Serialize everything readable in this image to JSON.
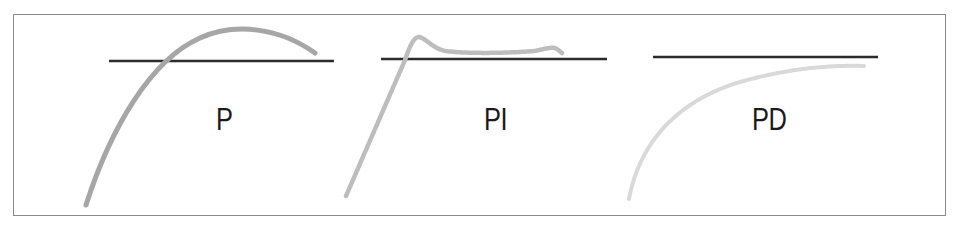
{
  "diagram": {
    "title": "",
    "panels": [
      {
        "id": "p",
        "label": "P",
        "response_style": "solid",
        "response_color": "#a6a6a6",
        "behavior": "rises steeply, overshoots setpoint, peaks, then falls back toward setpoint"
      },
      {
        "id": "pi",
        "label": "PI",
        "response_style": "dashed",
        "response_color": "#bdbdbd",
        "behavior": "rises steeply, small overshoot peak, settles slightly above setpoint"
      },
      {
        "id": "pd",
        "label": "PD",
        "response_style": "dotted",
        "response_color": "#d9d9d9",
        "behavior": "rises smoothly and asymptotically approaches setpoint from below without overshoot"
      }
    ],
    "setpoint_color": "#2b2b2b",
    "frame_color": "#8a8a8a"
  }
}
